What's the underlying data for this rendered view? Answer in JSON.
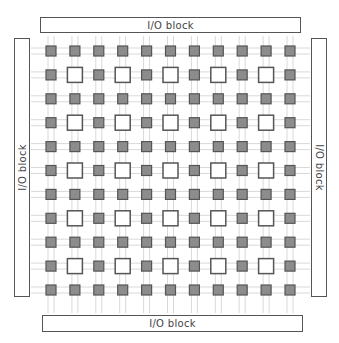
{
  "diagram": {
    "io_blocks": {
      "top": {
        "label": "I/O block"
      },
      "bottom": {
        "label": "I/O block"
      },
      "left": {
        "label": "I/O block"
      },
      "right": {
        "label": "I/O block"
      }
    },
    "grid": {
      "rows": 11,
      "cols": 11,
      "origin_x": 51,
      "origin_y": 51,
      "step": 23.9,
      "small_block_size": 10,
      "large_block_size": 15,
      "large_block_rule": "odd row and odd column",
      "large_block_positions_note": "5 x 5 = 25 open logic blocks at rows/cols 1,3,5,7,9"
    },
    "colors": {
      "switch_box_fill": "#8c8c8c",
      "switch_box_stroke": "#555555",
      "logic_block_fill": "#ffffff",
      "logic_block_stroke": "#555555",
      "routing_line": "#d9d9d9",
      "io_border": "#555555",
      "text": "#444444"
    }
  }
}
